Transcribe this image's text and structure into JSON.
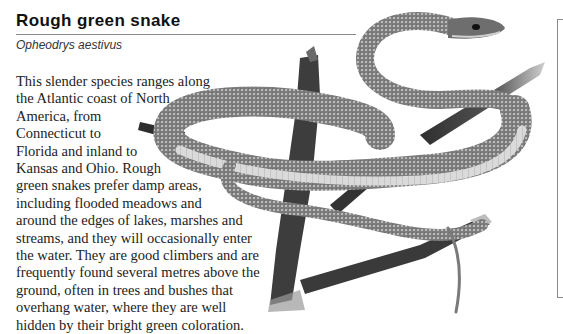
{
  "header": {
    "title": "Rough green snake",
    "subtitle": "Opheodrys aestivus"
  },
  "body": {
    "lines": [
      "This slender species ranges along",
      "the Atlantic coast of North",
      "America, from",
      "Connecticut to",
      "Florida and inland to",
      "Kansas and Ohio. Rough",
      "green snakes prefer damp areas,",
      "including flooded meadows and",
      "around the edges of lakes, marshes and",
      "streams, and they will occasionally enter",
      "the water. They are good climbers and are",
      "frequently found several metres above the",
      "ground, often in trees and bushes that",
      "overhang water, where they are well",
      "hidden by their bright green coloration."
    ]
  },
  "illustration": {
    "subject": "rough-green-snake-on-branch",
    "colors": {
      "scales_dark": "#4a4a4a",
      "scales_mid": "#8c8c8c",
      "belly": "#d8d8d8",
      "branch": "#3a3a3a"
    }
  },
  "colors": {
    "rule": "#8a8a8a",
    "text": "#222222",
    "background": "#ffffff"
  }
}
